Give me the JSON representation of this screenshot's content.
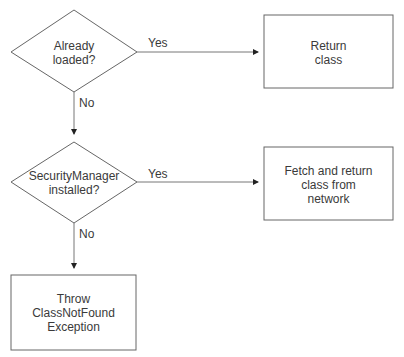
{
  "diagram": {
    "type": "flowchart",
    "nodes": [
      {
        "id": "d1",
        "shape": "diamond",
        "text": "Already\nloaded?",
        "line1": "Already",
        "line2": "loaded?"
      },
      {
        "id": "b1",
        "shape": "rect",
        "line1": "Return",
        "line2": "class"
      },
      {
        "id": "d2",
        "shape": "diamond",
        "line1": "SecurityManager",
        "line2": "installed?"
      },
      {
        "id": "b2",
        "shape": "rect",
        "line1": "Fetch and return",
        "line2": "class from",
        "line3": "network"
      },
      {
        "id": "b3",
        "shape": "rect",
        "line1": "Throw",
        "line2": "ClassNotFound",
        "line3": "Exception"
      }
    ],
    "edges": [
      {
        "from": "d1",
        "to": "b1",
        "label": "Yes"
      },
      {
        "from": "d1",
        "to": "d2",
        "label": "No"
      },
      {
        "from": "d2",
        "to": "b2",
        "label": "Yes"
      },
      {
        "from": "d2",
        "to": "b3",
        "label": "No"
      }
    ],
    "colors": {
      "stroke": "#555555",
      "text": "#3a3a3a",
      "background": "#ffffff"
    }
  }
}
